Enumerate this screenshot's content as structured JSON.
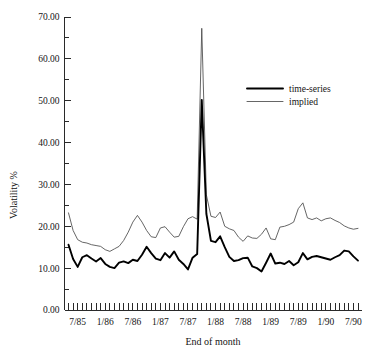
{
  "chart_data": {
    "type": "line",
    "title": "",
    "xlabel": "End of month",
    "ylabel": "Volatility %",
    "ylim": [
      0,
      70
    ],
    "ytick_labels": [
      "0.00",
      "10.00",
      "20.00",
      "30.00",
      "40.00",
      "50.00",
      "60.00",
      "70.00"
    ],
    "ytick_values": [
      0,
      10,
      20,
      30,
      40,
      50,
      60,
      70
    ],
    "yminor_step": 5,
    "xtick_labels": [
      "7/85",
      "1/86",
      "7/86",
      "1/87",
      "7/87",
      "1/88",
      "7/88",
      "1/89",
      "7/89",
      "1/90",
      "7/90"
    ],
    "x_minor_tick_interval_months": 1,
    "x_major_tick_interval_months": 6,
    "grid": false,
    "legend_position": "upper-right",
    "x": [
      "5/85",
      "6/85",
      "7/85",
      "8/85",
      "9/85",
      "10/85",
      "11/85",
      "12/85",
      "1/86",
      "2/86",
      "3/86",
      "4/86",
      "5/86",
      "6/86",
      "7/86",
      "8/86",
      "9/86",
      "10/86",
      "11/86",
      "12/86",
      "1/87",
      "2/87",
      "3/87",
      "4/87",
      "5/87",
      "6/87",
      "7/87",
      "8/87",
      "9/87",
      "10/87",
      "11/87",
      "12/87",
      "1/88",
      "2/88",
      "3/88",
      "4/88",
      "5/88",
      "6/88",
      "7/88",
      "8/88",
      "9/88",
      "10/88",
      "11/88",
      "12/88",
      "1/89",
      "2/89",
      "3/89",
      "4/89",
      "5/89",
      "6/89",
      "7/89",
      "8/89",
      "9/89",
      "10/89",
      "11/89",
      "12/89",
      "1/90",
      "2/90",
      "3/90",
      "4/90",
      "5/90",
      "6/90",
      "7/90",
      "8/90"
    ],
    "series": [
      {
        "name": "time-series",
        "style": "thick-black",
        "color": "#000000",
        "values": [
          15.6,
          12.2,
          10.3,
          12.6,
          13.1,
          12.3,
          11.6,
          12.4,
          11.0,
          10.3,
          10.0,
          11.3,
          11.6,
          11.2,
          12.0,
          11.7,
          13.2,
          15.1,
          13.6,
          12.3,
          11.9,
          13.6,
          12.5,
          14.0,
          12.0,
          11.0,
          9.7,
          12.5,
          13.4,
          50.2,
          23.0,
          16.5,
          16.2,
          17.6,
          15.0,
          12.7,
          11.7,
          11.9,
          12.4,
          12.5,
          10.4,
          10.0,
          9.2,
          11.3,
          13.5,
          11.1,
          11.3,
          11.0,
          11.7,
          10.7,
          11.4,
          13.6,
          12.1,
          12.7,
          12.9,
          12.6,
          12.3,
          12.0,
          12.6,
          13.1,
          14.2,
          14.0,
          12.8,
          11.8
        ]
      },
      {
        "name": "implied",
        "style": "thin-gray",
        "color": "#4a4a4a",
        "values": [
          23.2,
          19.0,
          16.8,
          16.2,
          16.0,
          15.6,
          15.4,
          15.2,
          14.4,
          14.0,
          14.6,
          15.2,
          16.6,
          18.6,
          21.0,
          22.6,
          21.0,
          19.0,
          17.5,
          17.3,
          19.6,
          19.9,
          18.6,
          17.4,
          17.6,
          19.9,
          21.8,
          22.3,
          21.7,
          67.3,
          27.5,
          22.4,
          22.1,
          23.4,
          20.0,
          19.4,
          19.0,
          17.4,
          16.4,
          17.7,
          17.2,
          17.1,
          18.1,
          19.6,
          17.0,
          16.8,
          19.8,
          20.0,
          20.4,
          21.0,
          24.2,
          25.6,
          22.0,
          21.6,
          22.0,
          21.3,
          21.8,
          22.0,
          21.4,
          20.9,
          20.1,
          19.6,
          19.3,
          19.5
        ]
      }
    ]
  },
  "legend": {
    "items": [
      {
        "label": "time-series"
      },
      {
        "label": "implied"
      }
    ]
  },
  "axes": {
    "y_title": "Volatility %",
    "x_title": "End of month"
  }
}
